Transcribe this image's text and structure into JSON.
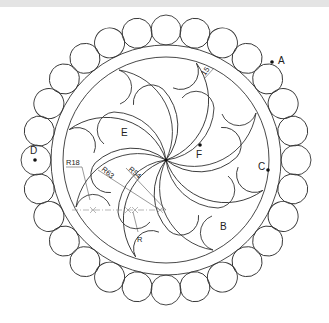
{
  "figure": {
    "type": "geometric construction drawing",
    "center": [
      166,
      160
    ],
    "outer_band": {
      "outer_radius": 115,
      "inner_radius": 103,
      "width_label": "15"
    },
    "bead_ring": {
      "count": 28,
      "radius": 15,
      "center_radius": 130
    },
    "petals": {
      "count": 8
    }
  },
  "labels": {
    "A": "A",
    "B": "B",
    "C": "C",
    "D": "D",
    "E": "E",
    "F": "F"
  },
  "dimensions": {
    "r18": "R18",
    "r63": "R63",
    "r54": "R54",
    "r": "R",
    "band_width": "15"
  },
  "colors": {
    "line": "#333333",
    "centerline": "#888888",
    "top_band": "#e4e4e4",
    "background": "#ffffff"
  }
}
